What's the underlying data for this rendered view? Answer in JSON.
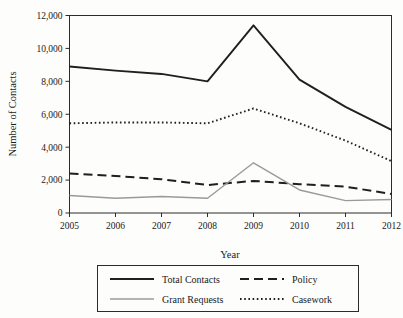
{
  "chart_data": {
    "type": "line",
    "title": "",
    "xlabel": "Year",
    "ylabel": "Number of Contacts",
    "categories": [
      2005,
      2006,
      2007,
      2008,
      2009,
      2010,
      2011,
      2012
    ],
    "x_tick_labels": [
      "2005",
      "2006",
      "2007",
      "2008",
      "2009",
      "2010",
      "2011",
      "2012"
    ],
    "y_tick_labels": [
      "0",
      "2,000",
      "4,000",
      "6,000",
      "8,000",
      "10,000",
      "12,000"
    ],
    "y_ticks": [
      0,
      2000,
      4000,
      6000,
      8000,
      10000,
      12000
    ],
    "xlim": [
      2005,
      2012
    ],
    "ylim": [
      0,
      12000
    ],
    "grid": false,
    "legend_position": "below-plot",
    "series": [
      {
        "name": "Total Contacts",
        "style": "solid",
        "color": "#1f1f1f",
        "width": 1.9,
        "values": [
          8900,
          8650,
          8450,
          8000,
          11400,
          8100,
          6450,
          5050
        ]
      },
      {
        "name": "Policy",
        "style": "dashed",
        "color": "#1f1f1f",
        "width": 2.0,
        "values": [
          2400,
          2250,
          2050,
          1700,
          1950,
          1750,
          1600,
          1150
        ]
      },
      {
        "name": "Grant Requests",
        "style": "thin-gray",
        "color": "#9a9a9a",
        "width": 1.4,
        "values": [
          1060,
          900,
          1000,
          900,
          3050,
          1400,
          750,
          820
        ]
      },
      {
        "name": "Casework",
        "style": "dotted",
        "color": "#1f1f1f",
        "width": 1.9,
        "values": [
          5450,
          5500,
          5500,
          5450,
          6350,
          5450,
          4400,
          3150
        ]
      }
    ]
  },
  "legend": {
    "entries": [
      {
        "label": "Total Contacts",
        "series": "Total Contacts"
      },
      {
        "label": "Policy",
        "series": "Policy"
      },
      {
        "label": "Grant Requests",
        "series": "Grant Requests"
      },
      {
        "label": "Casework",
        "series": "Casework"
      }
    ]
  }
}
